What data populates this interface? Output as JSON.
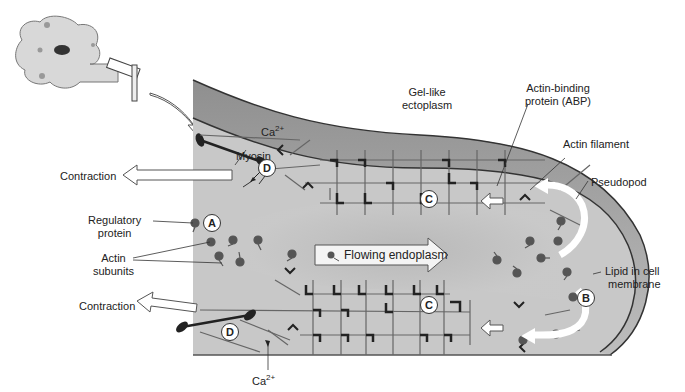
{
  "labels": {
    "gel_ectoplasm": [
      "Gel-like",
      "ectoplasm"
    ],
    "abp": [
      "Actin-binding",
      "protein (ABP)"
    ],
    "actin_filament": "Actin filament",
    "pseudopod": "Pseudopod",
    "lipid": [
      "Lipid in cell",
      "membrane"
    ],
    "contraction_top": "Contraction",
    "contraction_bottom": "Contraction",
    "regulatory": [
      "Regulatory",
      "protein"
    ],
    "actin_subunits": [
      "Actin",
      "subunits"
    ],
    "myosin": "Myosin",
    "ca_top": "Ca",
    "ca_bottom": "Ca",
    "ca_sup": "2+",
    "flowing": "Flowing endoplasm"
  },
  "markers": {
    "A": "A",
    "B": "B",
    "C1": "C",
    "C2": "C",
    "D1": "D",
    "D2": "D"
  },
  "colors": {
    "cytoplasm": "#c8c8c8",
    "ectoplasm_band": "#a8a8a8",
    "filament": "#666666",
    "dark": "#333333"
  }
}
